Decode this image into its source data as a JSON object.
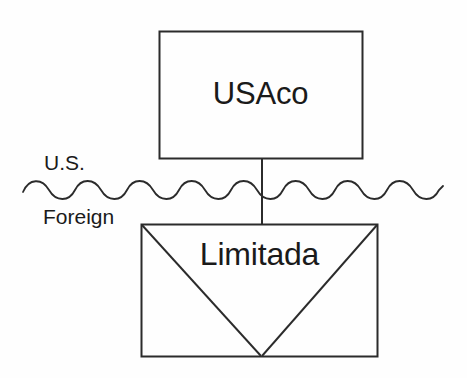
{
  "diagram": {
    "type": "ownership-structure-diagram",
    "background_color": "#fefefe",
    "line_color": "#2b2b2b",
    "text_color": "#1a1a1a",
    "nodes": [
      {
        "id": "usaco",
        "label": "USAco",
        "shape": "rectangle",
        "jurisdiction": "U.S.",
        "x": 159,
        "y": 31,
        "width": 204,
        "height": 128
      },
      {
        "id": "limitada",
        "label": "Limitada",
        "shape": "rectangle-with-v-diagonals",
        "jurisdiction": "Foreign",
        "x": 141,
        "y": 224,
        "width": 237,
        "height": 133
      }
    ],
    "connector": {
      "name": "ownership-line",
      "from": "usaco",
      "to": "limitada",
      "x": 262,
      "y_start": 159,
      "y_end": 224
    },
    "border_separator": {
      "name": "jurisdiction-border",
      "style": "wavy",
      "x_start": 23,
      "x_end": 443,
      "y": 190,
      "wavelength": 52,
      "amplitude": 7
    },
    "region_labels": [
      {
        "id": "us",
        "label": "U.S."
      },
      {
        "id": "foreign",
        "label": "Foreign"
      }
    ]
  }
}
